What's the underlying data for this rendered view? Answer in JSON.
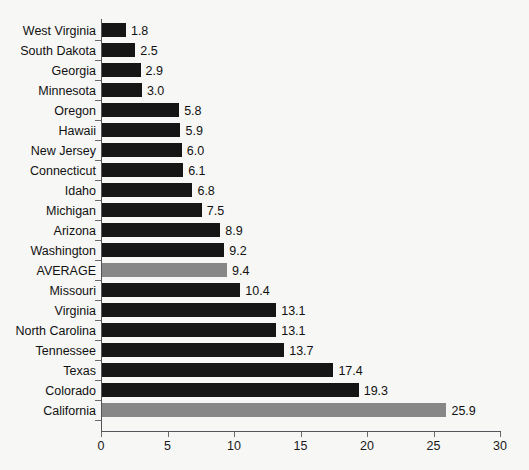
{
  "chart_data": {
    "type": "bar",
    "orientation": "horizontal",
    "title": "",
    "subtitle": "",
    "xlabel": "",
    "ylabel": "",
    "xlim": [
      0,
      30
    ],
    "xticks": [
      0,
      5,
      10,
      15,
      20,
      25,
      30
    ],
    "xtick_labels": [
      "0",
      "5",
      "10",
      "15",
      "20",
      "25",
      "30"
    ],
    "grid": false,
    "legend": null,
    "value_label_format": "one-decimal",
    "colors": {
      "bar_default": "#151515",
      "bar_highlight": "#878787",
      "axis": "#55555a",
      "text": "#111111",
      "background": "#f7f7f5"
    },
    "categories": [
      "West Virginia",
      "South Dakota",
      "Georgia",
      "Minnesota",
      "Oregon",
      "Hawaii",
      "New Jersey",
      "Connecticut",
      "Idaho",
      "Michigan",
      "Arizona",
      "Washington",
      "AVERAGE",
      "Missouri",
      "Virginia",
      "North Carolina",
      "Tennessee",
      "Texas",
      "Colorado",
      "California"
    ],
    "values": [
      1.8,
      2.5,
      2.9,
      3.0,
      5.8,
      5.9,
      6.0,
      6.1,
      6.8,
      7.5,
      8.9,
      9.2,
      9.4,
      10.4,
      13.1,
      13.1,
      13.7,
      17.4,
      19.3,
      25.9
    ],
    "value_labels": [
      "1.8",
      "2.5",
      "2.9",
      "3.0",
      "5.8",
      "5.9",
      "6.0",
      "6.1",
      "6.8",
      "7.5",
      "8.9",
      "9.2",
      "9.4",
      "10.4",
      "13.1",
      "13.1",
      "13.7",
      "17.4",
      "19.3",
      "25.9"
    ],
    "highlighted": [
      false,
      false,
      false,
      false,
      false,
      false,
      false,
      false,
      false,
      false,
      false,
      false,
      true,
      false,
      false,
      false,
      false,
      false,
      false,
      true
    ],
    "bars": [
      {
        "category": "West Virginia",
        "value": 1.8,
        "label": "1.8",
        "highlighted": false
      },
      {
        "category": "South Dakota",
        "value": 2.5,
        "label": "2.5",
        "highlighted": false
      },
      {
        "category": "Georgia",
        "value": 2.9,
        "label": "2.9",
        "highlighted": false
      },
      {
        "category": "Minnesota",
        "value": 3.0,
        "label": "3.0",
        "highlighted": false
      },
      {
        "category": "Oregon",
        "value": 5.8,
        "label": "5.8",
        "highlighted": false
      },
      {
        "category": "Hawaii",
        "value": 5.9,
        "label": "5.9",
        "highlighted": false
      },
      {
        "category": "New Jersey",
        "value": 6.0,
        "label": "6.0",
        "highlighted": false
      },
      {
        "category": "Connecticut",
        "value": 6.1,
        "label": "6.1",
        "highlighted": false
      },
      {
        "category": "Idaho",
        "value": 6.8,
        "label": "6.8",
        "highlighted": false
      },
      {
        "category": "Michigan",
        "value": 7.5,
        "label": "7.5",
        "highlighted": false
      },
      {
        "category": "Arizona",
        "value": 8.9,
        "label": "8.9",
        "highlighted": false
      },
      {
        "category": "Washington",
        "value": 9.2,
        "label": "9.2",
        "highlighted": false
      },
      {
        "category": "AVERAGE",
        "value": 9.4,
        "label": "9.4",
        "highlighted": true
      },
      {
        "category": "Missouri",
        "value": 10.4,
        "label": "10.4",
        "highlighted": false
      },
      {
        "category": "Virginia",
        "value": 13.1,
        "label": "13.1",
        "highlighted": false
      },
      {
        "category": "North Carolina",
        "value": 13.1,
        "label": "13.1",
        "highlighted": false
      },
      {
        "category": "Tennessee",
        "value": 13.7,
        "label": "13.7",
        "highlighted": false
      },
      {
        "category": "Texas",
        "value": 17.4,
        "label": "17.4",
        "highlighted": false
      },
      {
        "category": "Colorado",
        "value": 19.3,
        "label": "19.3",
        "highlighted": false
      },
      {
        "category": "California",
        "value": 25.9,
        "label": "25.9",
        "highlighted": true
      }
    ]
  }
}
